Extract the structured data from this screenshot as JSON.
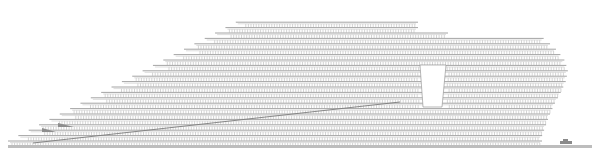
{
  "drawing": {
    "type": "architectural-elevation",
    "colors": {
      "background": "#ffffff",
      "line": "#9a9a9a",
      "ground": "#bdbdbd",
      "accent": "#7d7d7d"
    },
    "ground": {
      "x1": 8,
      "x2": 592,
      "y": 145,
      "thickness": 3
    },
    "floor_spacing": 5.4,
    "left_block": {
      "base_y": 141,
      "top_y": 20,
      "left_edge_bottom_x": 8,
      "left_edge_top_x": 240,
      "right_x": 418
    },
    "right_block": {
      "top_y": 37,
      "profile": [
        {
          "y": 37,
          "left": 448,
          "right": 542
        },
        {
          "y": 48,
          "left": 448,
          "right": 555
        },
        {
          "y": 59,
          "left": 448,
          "right": 564
        },
        {
          "y": 70,
          "left": 448,
          "right": 568
        },
        {
          "y": 81,
          "left": 448,
          "right": 566
        },
        {
          "y": 92,
          "left": 448,
          "right": 561
        },
        {
          "y": 103,
          "left": 448,
          "right": 555
        },
        {
          "y": 114,
          "left": 448,
          "right": 550
        },
        {
          "y": 125,
          "left": 448,
          "right": 546
        },
        {
          "y": 136,
          "left": 448,
          "right": 542
        }
      ]
    },
    "upper_connector": {
      "y_top": 20,
      "y_bottom": 37,
      "left": 418,
      "right": 452
    },
    "void": {
      "x1": 420,
      "x2": 446,
      "x1_bottom": 423,
      "x2_bottom": 442,
      "y1": 65,
      "y2": 107
    },
    "ramp": {
      "x1": 33,
      "y1": 143,
      "x2": 400,
      "y2": 102
    },
    "stair_wedges": [
      {
        "x": 42,
        "y": 128,
        "w": 14,
        "h": 4
      },
      {
        "x": 58,
        "y": 123,
        "w": 16,
        "h": 4
      }
    ],
    "car": {
      "x": 560,
      "y": 140
    },
    "mullion_spacing": 2.6
  }
}
